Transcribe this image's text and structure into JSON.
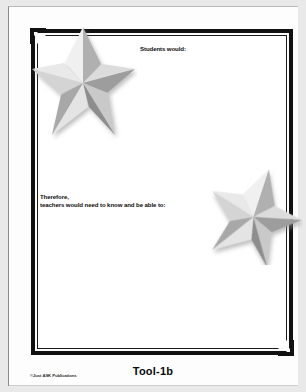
{
  "document": {
    "page_type": "worksheet",
    "prompts": [
      {
        "id": "students",
        "text": "Students would:"
      },
      {
        "id": "teachers",
        "text": "Therefore,\nteachers would need to know and be able to:"
      }
    ],
    "decorations": [
      {
        "id": "star-large",
        "icon": "star-icon"
      },
      {
        "id": "star-small",
        "icon": "star-icon"
      }
    ],
    "footer": {
      "copyright": "©Just ASK Publications",
      "tool_label": "Tool-1b"
    },
    "colors": {
      "frame": "#111111",
      "text": "#0d0d0d",
      "star_light": "#e2e2e2",
      "star_mid": "#b4b4b4",
      "star_dark": "#8f8f8f",
      "page": "#ffffff",
      "scan_background": "#e9e9e9"
    }
  }
}
